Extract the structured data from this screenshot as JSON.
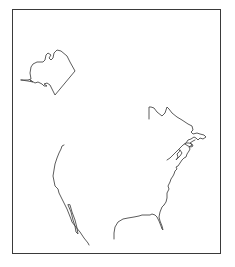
{
  "map": {
    "type": "outline-map",
    "region": "North America coastlines",
    "frame": {
      "left": 12,
      "top": 9,
      "right": 221,
      "bottom": 254,
      "color": "#3a3a3a"
    },
    "line_color": "#4a4a4a",
    "features": [
      {
        "name": "alaska",
        "label": ""
      },
      {
        "name": "pacific-coast",
        "label": ""
      },
      {
        "name": "baja-california",
        "label": ""
      },
      {
        "name": "gulf-coast",
        "label": ""
      },
      {
        "name": "atlantic-coast",
        "label": ""
      },
      {
        "name": "florida",
        "label": ""
      },
      {
        "name": "northeast-maritimes",
        "label": ""
      }
    ]
  }
}
